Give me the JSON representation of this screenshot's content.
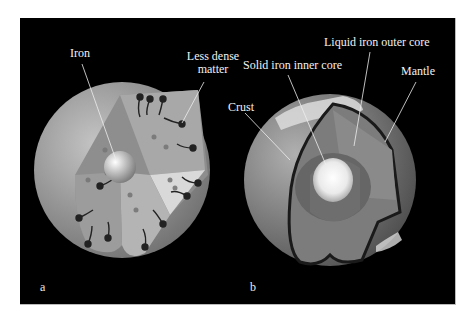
{
  "panels": [
    {
      "letter": "a",
      "labels": {
        "iron": "Iron",
        "less_dense_line1": "Less dense",
        "less_dense_line2": "matter"
      }
    },
    {
      "letter": "b",
      "labels": {
        "liquid_outer_core": "Liquid iron outer core",
        "solid_inner_core": "Solid iron inner core",
        "mantle": "Mantle",
        "crust": "Crust"
      }
    }
  ],
  "colors": {
    "background": "#000000",
    "label_text": "#f2f2f2",
    "sphere_gray": "#9a9a9a"
  }
}
